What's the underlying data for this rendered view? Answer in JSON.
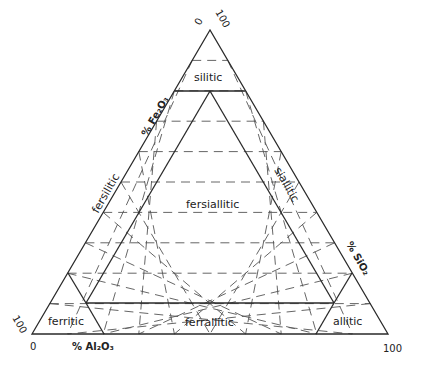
{
  "diagram": {
    "title": "",
    "type": "ternary",
    "line_color": "#2a2a2a",
    "background": "#ffffff",
    "vertices": {
      "top": {
        "tick_left": "0",
        "tick_right": "100"
      },
      "bottom_left": {
        "tick_top": "100",
        "tick_bottom": "0"
      },
      "bottom_right": {
        "tick": "100"
      }
    },
    "axes": {
      "left": "% Fe₂O₃",
      "right": "% SiO₂",
      "bottom": "% Al₂O₃"
    },
    "regions": [
      {
        "id": "silitic",
        "label": "silitic"
      },
      {
        "id": "fersilitic",
        "label": "fersilitic"
      },
      {
        "id": "fersiallitic",
        "label": "fersiallitic"
      },
      {
        "id": "siallitic",
        "label": "siallitic"
      },
      {
        "id": "ferritic",
        "label": "ferritic"
      },
      {
        "id": "ferrallitic",
        "label": "ferrallitic"
      },
      {
        "id": "allitic",
        "label": "allitic"
      }
    ],
    "grid": {
      "divisions": 10,
      "style": "dashed"
    }
  }
}
